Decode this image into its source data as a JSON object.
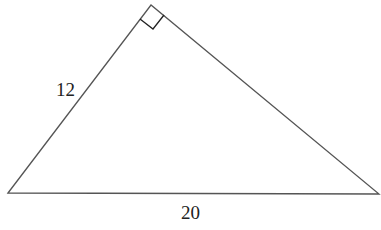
{
  "diagram": {
    "type": "right-triangle",
    "vertices": {
      "left": [
        8,
        193
      ],
      "apex": [
        151,
        5
      ],
      "right": [
        379,
        194
      ]
    },
    "right_angle_at": "apex",
    "labels": {
      "left_side": "12",
      "hypotenuse": "20"
    },
    "colors": {
      "stroke": "#555555",
      "marker": "#222222",
      "text": "#222222",
      "background": "#ffffff"
    }
  }
}
